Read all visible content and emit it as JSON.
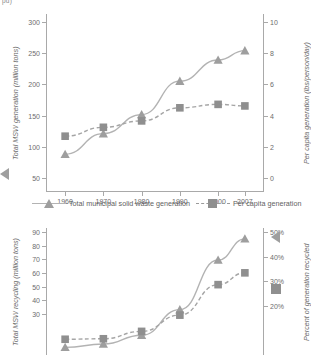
{
  "clipped_header_text": "pd)",
  "legend": {
    "items": [
      {
        "label": "Total municipal solid waste generation",
        "marker": "triangle-marker",
        "line": "solid",
        "color": "#9e9e9e"
      },
      {
        "label": "Per capita generation",
        "marker": "square-marker",
        "line": "dashed",
        "color": "#8f8f8f"
      }
    ]
  },
  "chart_data": [
    {
      "id": "msw-generation",
      "type": "line",
      "title": "",
      "xlabel": "",
      "categories": [
        "1960",
        "1970",
        "1980",
        "1990",
        "2000",
        "2007"
      ],
      "x": [
        1960,
        1970,
        1980,
        1990,
        2000,
        2007
      ],
      "grid": false,
      "legend_position": "bottom",
      "axes": {
        "left": {
          "label": "Total MSW generation (million tons)",
          "ticks": [
            50,
            100,
            150,
            200,
            250,
            300
          ],
          "ticklabels": [
            "50",
            "100",
            "150",
            "200",
            "250",
            "300"
          ],
          "lim": [
            50,
            300
          ]
        },
        "right": {
          "label": "Per capita generation (lbs/person/day)",
          "ticks": [
            0,
            2,
            4,
            6,
            8,
            10
          ],
          "ticklabels": [
            "0",
            "2",
            "4",
            "6",
            "8",
            "10"
          ],
          "lim": [
            0,
            10
          ]
        }
      },
      "series": [
        {
          "name": "Total municipal solid waste generation",
          "axis": "left",
          "marker": "triangle",
          "line": "solid",
          "values": [
            88.1,
            121.1,
            151.6,
            205.2,
            239.1,
            254.1
          ]
        },
        {
          "name": "Per capita generation",
          "axis": "right",
          "marker": "square",
          "line": "dashed",
          "values": [
            2.68,
            3.25,
            3.66,
            4.5,
            4.72,
            4.62
          ]
        }
      ]
    },
    {
      "id": "msw-recycling",
      "type": "line",
      "title": "",
      "xlabel": "",
      "categories": [
        "1960",
        "1970",
        "1980",
        "1990",
        "2000",
        "2007"
      ],
      "x": [
        1960,
        1970,
        1980,
        1990,
        2000,
        2007
      ],
      "grid": false,
      "legend_position": "none",
      "axes": {
        "left": {
          "label": "Total MSW recycling (million tons)",
          "ticks": [
            30,
            40,
            50,
            60,
            70,
            80,
            90
          ],
          "ticklabels": [
            "30",
            "40",
            "50",
            "60",
            "70",
            "80",
            "90"
          ],
          "lim": [
            0,
            90
          ]
        },
        "right": {
          "label": "Percent of generation recycled",
          "ticks": [
            20,
            30,
            40,
            50
          ],
          "ticklabels": [
            "20%",
            "30%",
            "40%",
            "50%"
          ],
          "lim": [
            0,
            50
          ]
        }
      },
      "series": [
        {
          "name": "Total MSW recycling",
          "axis": "left",
          "marker": "triangle",
          "line": "solid",
          "values": [
            5.6,
            8.0,
            14.5,
            33.2,
            69.5,
            85.0
          ]
        },
        {
          "name": "Percent of generation recycled",
          "axis": "right",
          "marker": "square",
          "line": "dashed",
          "values": [
            6.4,
            6.6,
            9.6,
            16.2,
            28.6,
            33.4
          ]
        }
      ]
    }
  ]
}
